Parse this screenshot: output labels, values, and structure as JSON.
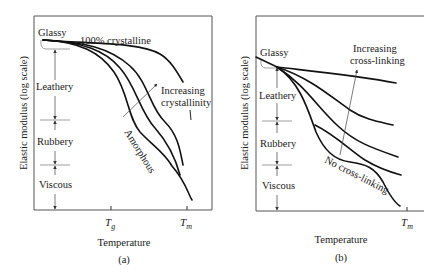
{
  "figure": {
    "panels": [
      {
        "id": "a",
        "caption": "(a)",
        "ylabel": "Elastic modulus (log scale)",
        "xlabel": "Temperature",
        "x_ticks": [
          "T",
          "T"
        ],
        "x_tick_subscripts": [
          "g",
          "m"
        ],
        "regions": [
          "Glassy",
          "Leathery",
          "Rubbery",
          "Viscous"
        ],
        "annotations": {
          "top_curve": "100% crystalline",
          "arrow_label_line1": "Increasing",
          "arrow_label_line2": "crystallinity",
          "bottom_curve": "Amorphous"
        },
        "curve_count": 4
      },
      {
        "id": "b",
        "caption": "(b)",
        "ylabel": "Elastic modulus (log scale)",
        "xlabel": "Temperature",
        "x_ticks": [
          "T"
        ],
        "x_tick_subscripts": [
          "m"
        ],
        "regions": [
          "Glassy",
          "Leathery",
          "Rubbery",
          "Viscous"
        ],
        "annotations": {
          "arrow_label_line1": "Increasing",
          "arrow_label_line2": "cross-linking",
          "bottom_curve": "No cross-linking"
        },
        "curve_count": 5
      }
    ]
  }
}
